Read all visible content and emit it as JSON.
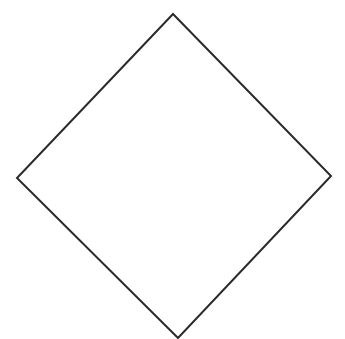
{
  "diagram": {
    "shape": "diamond",
    "stroke_color": "#2a2a2a",
    "fill_color": "#ffffff",
    "background_color": "#ffffff",
    "stroke_width": 2,
    "vertices": {
      "top": [
        173,
        14
      ],
      "right": [
        331,
        176
      ],
      "bottom": [
        178,
        338
      ],
      "left": [
        17,
        178
      ]
    }
  }
}
